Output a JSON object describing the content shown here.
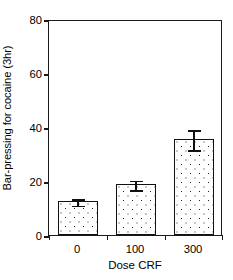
{
  "chart_data": {
    "type": "bar",
    "title": "",
    "xlabel": "Dose CRF",
    "ylabel": "Bar-pressing for cocaine (3hr)",
    "categories": [
      "0",
      "100",
      "300"
    ],
    "values": [
      12.5,
      18.8,
      35.5
    ],
    "errors": [
      1.5,
      2.0,
      4.0
    ],
    "series": [
      {
        "name": "Bar-pressing for cocaine (3hr)",
        "values": [
          12.5,
          18.8,
          35.5
        ],
        "errors": [
          1.5,
          2.0,
          4.0
        ]
      }
    ],
    "ylim": [
      0,
      80
    ],
    "yticks": [
      0,
      20,
      40,
      60,
      80
    ],
    "ytick_labels": [
      "0",
      "20",
      "40",
      "60",
      "80"
    ],
    "xtick_labels": [
      "0",
      "100",
      "300"
    ],
    "grid": false,
    "legend": false,
    "legend_position": "none",
    "bar_fill": "dotted-stipple-on-white",
    "bar_edge_color": "#111111",
    "error_bar_style": "capped-i-beam",
    "axis_frame": "full-box",
    "tick_direction": "out"
  }
}
